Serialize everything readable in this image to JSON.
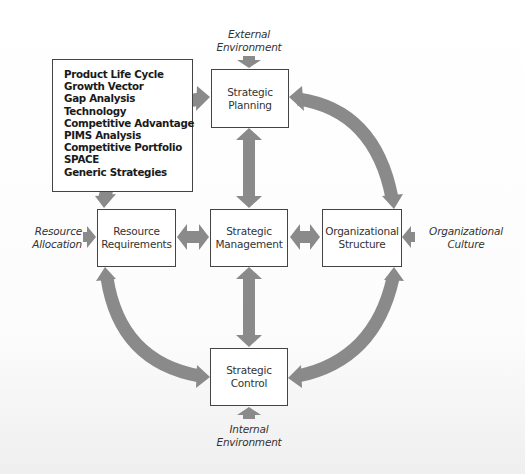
{
  "diagram": {
    "type": "strategic-management-cycle",
    "colors": {
      "arrow": "#8a8a8a",
      "box_border": "#444444",
      "background": "#ffffff"
    },
    "tools_list": {
      "items": [
        "Product Life Cycle",
        "Growth Vector",
        "Gap Analysis",
        "Technology",
        "Competitive Advantage",
        "PIMS Analysis",
        "Competitive Portfolio",
        "SPACE",
        "Generic Strategies"
      ]
    },
    "nodes": {
      "planning": {
        "line1": "Strategic",
        "line2": "Planning"
      },
      "management": {
        "line1": "Strategic",
        "line2": "Management"
      },
      "resources": {
        "line1": "Resource",
        "line2": "Requirements"
      },
      "organization": {
        "line1": "Organizational",
        "line2": "Structure"
      },
      "control": {
        "line1": "Strategic",
        "line2": "Control"
      }
    },
    "external_inputs": {
      "external_environment": {
        "line1": "External",
        "line2": "Environment"
      },
      "internal_environment": {
        "line1": "Internal",
        "line2": "Environment"
      },
      "resource_allocation": {
        "line1": "Resource",
        "line2": "Allocation"
      },
      "organizational_culture": {
        "line1": "Organizational",
        "line2": "Culture"
      }
    },
    "edges": [
      {
        "from": "management",
        "to": "planning",
        "style": "double"
      },
      {
        "from": "management",
        "to": "control",
        "style": "double"
      },
      {
        "from": "management",
        "to": "resources",
        "style": "double"
      },
      {
        "from": "management",
        "to": "organization",
        "style": "double"
      },
      {
        "from": "planning",
        "to": "organization",
        "style": "curved-double"
      },
      {
        "from": "organization",
        "to": "control",
        "style": "curved-double"
      },
      {
        "from": "control",
        "to": "resources",
        "style": "curved-double"
      },
      {
        "from": "resources",
        "to": "planning",
        "style": "curved-double"
      },
      {
        "from": "external_environment",
        "to": "planning",
        "style": "single"
      },
      {
        "from": "internal_environment",
        "to": "control",
        "style": "single"
      },
      {
        "from": "resource_allocation",
        "to": "resources",
        "style": "single"
      },
      {
        "from": "organizational_culture",
        "to": "organization",
        "style": "single"
      }
    ]
  }
}
